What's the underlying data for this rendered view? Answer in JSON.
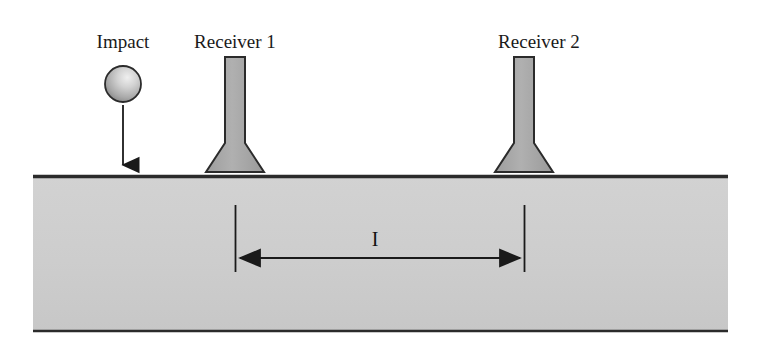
{
  "figure": {
    "kind": "impact-echo-test-setup-diagram",
    "background_color": "#ffffff"
  },
  "labels": {
    "impact": "Impact",
    "receiver_1": "Receiver 1",
    "receiver_2": "Receiver 2",
    "spacing_symbol": "I"
  },
  "colors": {
    "slab_fill": "#cdcdcd",
    "slab_edge": "#2b2b2b",
    "receiver_fill": "#a8a8a8",
    "receiver_outline": "#2b2b2b",
    "sphere_light": "#e8e8e8",
    "sphere_dark": "#8d8d8d",
    "sphere_outline": "#2b2b2b",
    "arrow": "#1a1a1a",
    "text": "#1a1a1a"
  },
  "geometry": {
    "canvas": {
      "width": 762,
      "height": 356
    },
    "slab": {
      "x": 33,
      "y": 175,
      "width": 695,
      "height": 157
    },
    "impact_sphere": {
      "cx": 123,
      "cy": 84,
      "r": 18
    },
    "impact_arrow": {
      "x": 123,
      "y_start": 105,
      "y_end": 174
    },
    "receiver_1": {
      "center_x": 235,
      "top_y": 57,
      "base_y": 172
    },
    "receiver_2": {
      "center_x": 524,
      "top_y": 57,
      "base_y": 172
    },
    "dimension": {
      "left_x": 235,
      "right_x": 524,
      "arrow_y": 258,
      "extension_top_y": 205,
      "extension_bottom_y": 272,
      "label_x": 375,
      "label_y": 246
    },
    "label_baseline_y": 48
  }
}
